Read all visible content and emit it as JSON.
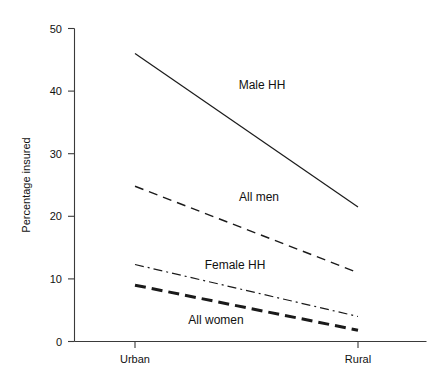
{
  "chart_data": {
    "type": "line",
    "title": "",
    "subtitle": "",
    "xlabel": "",
    "ylabel": "Percentage insured",
    "categories": [
      "Urban",
      "Rural"
    ],
    "x": [
      0,
      1
    ],
    "ylim": [
      0,
      50
    ],
    "y_ticks": [
      0,
      10,
      20,
      30,
      40,
      50
    ],
    "y_tick_labels": [
      "0",
      "10",
      "20",
      "30",
      "40",
      "50"
    ],
    "x_tick_labels": [
      "Urban",
      "Rural"
    ],
    "grid": false,
    "legend_position": "inline-annotations",
    "series": [
      {
        "name": "Male HH",
        "label": "Male HH",
        "values": [
          46,
          21.5
        ],
        "style": "solid",
        "dash": "none",
        "width": 1.2,
        "color": "#1a1a1a",
        "label_x": 262,
        "label_y": 89
      },
      {
        "name": "All men",
        "label": "All men",
        "values": [
          24.8,
          11
        ],
        "style": "dashed",
        "dash": "9,6",
        "width": 1.4,
        "color": "#1a1a1a",
        "label_x": 259,
        "label_y": 201
      },
      {
        "name": "Female HH",
        "label": "Female HH",
        "values": [
          12.3,
          4
        ],
        "style": "dash-dot",
        "dash": "9,4,2,4",
        "width": 1.2,
        "color": "#1a1a1a",
        "label_x": 235,
        "label_y": 269
      },
      {
        "name": "All women",
        "label": "All women",
        "values": [
          9,
          1.8
        ],
        "style": "thick-dashed",
        "dash": "11,6",
        "width": 3.0,
        "color": "#1a1a1a",
        "label_x": 216,
        "label_y": 324
      }
    ],
    "axis_colors": {
      "axis": "#3a3a3a",
      "text": "#111111",
      "background": "#ffffff"
    }
  }
}
